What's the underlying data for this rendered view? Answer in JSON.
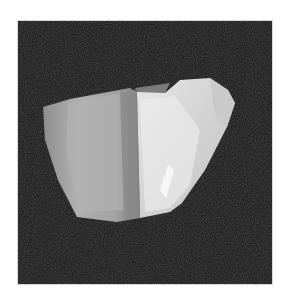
{
  "image": {
    "subject": "rendered faceted crystal / rock fragment",
    "background_color": "#111111",
    "page_background": "#ffffff",
    "object_colors": {
      "left_face": "#9a9a9a",
      "left_face_highlight": "#b8b8b8",
      "right_face": "#dcdcdc",
      "right_face_highlight": "#f2f2f2",
      "top_face": "#8a8a8a"
    }
  }
}
